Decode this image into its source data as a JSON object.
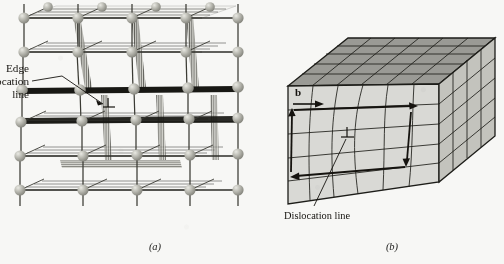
{
  "figure": {
    "background_color": "#f7f7f5",
    "ink_color": "#15130f",
    "panels": [
      {
        "id": "a",
        "caption": "(a)",
        "type": "atomic-ball-and-stick-lattice",
        "description": "Three-dimensional ball-and-stick atomic lattice containing an edge dislocation with an extra half-plane of atoms",
        "atom_color": "#b9b9b1",
        "bond_color": "#2a2a26",
        "annotations": [
          {
            "name": "edge-dislocation-label",
            "lines": [
              "Edge",
              "dislocation",
              "line"
            ],
            "has_leader_line": true,
            "has_arrow": true,
            "symbol": "⊥",
            "symbol_meaning": "inverted-tee edge dislocation symbol"
          }
        ]
      },
      {
        "id": "b",
        "caption": "(b)",
        "type": "continuum-block-burgers-circuit",
        "description": "Continuum block of crystal distorted by an edge dislocation, showing a Burgers circuit and the Burgers vector b",
        "top_face_color": "#9a9a95",
        "front_face_color": "#d9d9d5",
        "side_face_color": "#c3c3bd",
        "grid_color": "#1d1d19",
        "annotations": [
          {
            "name": "burgers-vector-label",
            "text": "b",
            "style": "bold",
            "meaning": "Burgers vector"
          },
          {
            "name": "dislocation-line-label",
            "text": "Dislocation line",
            "has_leader_line": true,
            "symbol": "⊥",
            "symbol_meaning": "inverted-tee edge dislocation symbol"
          }
        ]
      }
    ]
  }
}
